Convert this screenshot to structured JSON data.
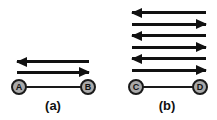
{
  "figure": {
    "diagrams": [
      {
        "id": "a",
        "caption": "(a)",
        "nodes": [
          "A",
          "B"
        ],
        "arrows": [
          {
            "dir": "left"
          },
          {
            "dir": "right"
          }
        ]
      },
      {
        "id": "b",
        "caption": "(b)",
        "nodes": [
          "C",
          "D"
        ],
        "arrows": [
          {
            "dir": "left"
          },
          {
            "dir": "right"
          },
          {
            "dir": "left"
          },
          {
            "dir": "right"
          },
          {
            "dir": "left"
          },
          {
            "dir": "right"
          }
        ]
      }
    ],
    "colors": {
      "background": "#ffffff",
      "arrow": "#111111",
      "node_fill": "#a9a9a9",
      "node_border": "#1a1a1a",
      "text": "#111111"
    }
  }
}
